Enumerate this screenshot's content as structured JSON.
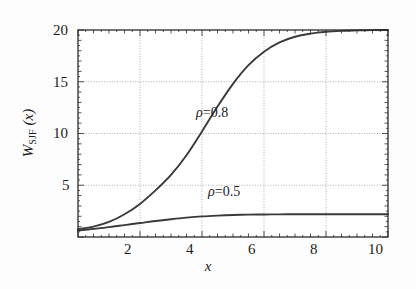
{
  "figure": {
    "background": "#fdfdfd",
    "frame_color": "#2b2b2b",
    "grid_color": "#8d8d8d",
    "curve_color": "#3a3a3a"
  },
  "axes": {
    "xlabel": "x",
    "ylabel_main": "W",
    "ylabel_sub": "SJF",
    "ylabel_arg": " (x)",
    "x_ticks": [
      "2",
      "4",
      "6",
      "8",
      "10"
    ],
    "y_ticks": [
      "5",
      "10",
      "15",
      "20"
    ]
  },
  "annotations": [
    {
      "name": "rho-0-8-label",
      "symbol": "ρ",
      "text": "=0.8"
    },
    {
      "name": "rho-0-5-label",
      "symbol": "ρ",
      "text": "=0.5"
    }
  ],
  "chart_data": {
    "type": "line",
    "title": "",
    "xlabel": "x",
    "ylabel": "W_SJF (x)",
    "xlim": [
      0,
      10
    ],
    "ylim": [
      0,
      20
    ],
    "xticks": [
      2,
      4,
      6,
      8,
      10
    ],
    "yticks": [
      5,
      10,
      15,
      20
    ],
    "grid": true,
    "legend": "inline-annotations",
    "x": [
      0,
      0.5,
      1,
      1.5,
      2,
      2.5,
      3,
      3.5,
      4,
      4.5,
      5,
      5.5,
      6,
      6.5,
      7,
      7.5,
      8,
      8.5,
      9,
      9.5,
      10
    ],
    "series": [
      {
        "name": "ρ=0.8",
        "rho": 0.8,
        "values": [
          0.75,
          1.0,
          1.45,
          2.2,
          3.2,
          4.5,
          6.0,
          7.9,
          10.2,
          12.6,
          14.8,
          16.6,
          17.9,
          18.8,
          19.35,
          19.65,
          19.83,
          19.92,
          19.96,
          19.99,
          20.0
        ]
      },
      {
        "name": "ρ=0.5",
        "rho": 0.5,
        "values": [
          0.62,
          0.78,
          0.95,
          1.15,
          1.35,
          1.55,
          1.72,
          1.87,
          1.99,
          2.07,
          2.13,
          2.16,
          2.18,
          2.19,
          2.2,
          2.2,
          2.2,
          2.2,
          2.2,
          2.2,
          2.2
        ]
      }
    ]
  }
}
